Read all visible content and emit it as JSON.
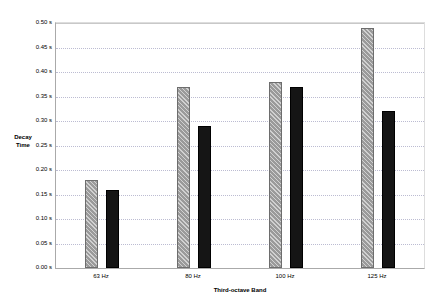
{
  "chart_data": {
    "type": "bar",
    "title": "",
    "xlabel": "Third-octave Band",
    "ylabel": "Decay Time",
    "ylabel_line1": "Decay",
    "ylabel_line2": "Time",
    "categories": [
      "63 Hz",
      "80 Hz",
      "100 Hz",
      "125 Hz"
    ],
    "series": [
      {
        "name": "Series A",
        "color": "#9a9a9a",
        "pattern": "diagonal-hatch",
        "values": [
          0.18,
          0.37,
          0.38,
          0.49
        ]
      },
      {
        "name": "Series B",
        "color": "#151515",
        "pattern": "solid",
        "values": [
          0.16,
          0.29,
          0.37,
          0.32
        ]
      }
    ],
    "ylim": [
      0.0,
      0.5
    ],
    "ytick_step": 0.05,
    "ytick_labels": [
      "0.00 s",
      "0.05 s",
      "0.10 s",
      "0.15 s",
      "0.20 s",
      "0.25 s",
      "0.30 s",
      "0.35 s",
      "0.40 s",
      "0.45 s",
      "0.50 s"
    ],
    "ytick_values": [
      0.0,
      0.05,
      0.1,
      0.15,
      0.2,
      0.25,
      0.3,
      0.35,
      0.4,
      0.45,
      0.5
    ],
    "grid": true,
    "grid_style": "dotted",
    "legend": "none",
    "legend_position": "none",
    "background": "#ffffff",
    "axis_color": "#aaaaaa",
    "grid_color": "#bcbcd2"
  }
}
